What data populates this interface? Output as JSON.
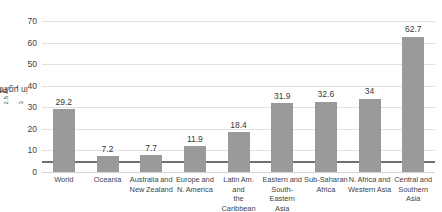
{
  "chart_data": {
    "type": "bar",
    "title": "",
    "xlabel": "",
    "ylabel": "PM2.5 in µg/m³",
    "ylabel_parts": {
      "prefix": "PM",
      "subscript": "2.5",
      "suffix": " in µg/m",
      "superscript": "3"
    },
    "ylim": [
      0,
      70
    ],
    "yticks": [
      0,
      10,
      20,
      30,
      40,
      50,
      60,
      70
    ],
    "ytick_labels": [
      "0",
      "10",
      "20",
      "30",
      "40",
      "50",
      "60",
      "70"
    ],
    "grid": true,
    "legend": "none",
    "bar_color": "#9a9a9a",
    "reference_line": {
      "value": 5,
      "color": "#6f6f6f"
    },
    "categories": [
      "World",
      "Oceania",
      "Australia and New Zealand",
      "Europe and N. America",
      "Latin Am. and the Caribbean",
      "Eastern and South-Eastern Asia",
      "Sub-Saharan Africa",
      "N. Africa and Western Asia",
      "Central and Southern Asia"
    ],
    "category_lines": [
      [
        "World",
        ""
      ],
      [
        "Oceania",
        ""
      ],
      [
        "Australia and",
        "New Zealand"
      ],
      [
        "Europe and",
        "N. America"
      ],
      [
        "Latin Am. and",
        "the Caribbean"
      ],
      [
        "Eastern and",
        "South-Eastern",
        "Asia"
      ],
      [
        "Sub-Saharan",
        "Africa"
      ],
      [
        "N. Africa and",
        "Western Asia"
      ],
      [
        "Central and",
        "Southern Asia"
      ]
    ],
    "values": [
      29.2,
      7.2,
      7.7,
      11.9,
      18.4,
      31.9,
      32.6,
      34,
      62.7
    ],
    "value_labels": [
      "29.2",
      "7.2",
      "7.7",
      "11.9",
      "18.4",
      "31.9",
      "32.6",
      "34",
      "62.7"
    ]
  }
}
